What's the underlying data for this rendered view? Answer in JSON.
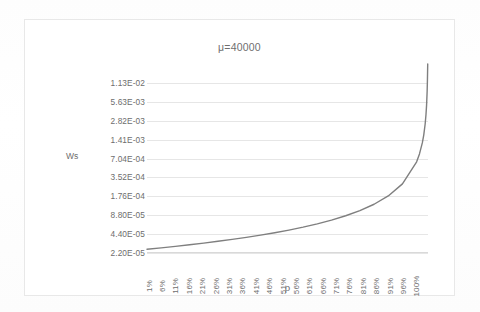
{
  "chart_data": {
    "type": "line",
    "title": "μ=40000",
    "xlabel": "ρ",
    "ylabel": "Ws",
    "yscale": "log",
    "grid": true,
    "legend": "none",
    "series_color": "#7f7f7f",
    "gridline_color": "#e6e6e6",
    "axis_text_color": "#6d6d6d",
    "y_tick_labels": [
      "1.13E-02",
      "5.63E-03",
      "2.82E-03",
      "1.41E-03",
      "7.04E-04",
      "3.52E-04",
      "1.76E-04",
      "8.80E-05",
      "4.40E-05",
      "2.20E-05"
    ],
    "y_tick_values": [
      0.0113,
      0.00563,
      0.00282,
      0.00141,
      0.000704,
      0.000352,
      0.000176,
      8.8e-05,
      4.4e-05,
      2.2e-05
    ],
    "ylim": [
      2.2e-05,
      0.0226
    ],
    "x_tick_labels": [
      "1%",
      "6%",
      "11%",
      "16%",
      "21%",
      "26%",
      "31%",
      "36%",
      "41%",
      "46%",
      "51%",
      "56%",
      "61%",
      "66%",
      "71%",
      "76%",
      "81%",
      "86%",
      "91%",
      "96%",
      "100%"
    ],
    "xlim": [
      0.01,
      1.0
    ],
    "x": [
      0.01,
      0.06,
      0.11,
      0.16,
      0.21,
      0.26,
      0.31,
      0.36,
      0.41,
      0.46,
      0.51,
      0.56,
      0.61,
      0.66,
      0.71,
      0.76,
      0.81,
      0.86,
      0.91,
      0.96,
      0.97,
      0.98,
      0.985,
      0.99,
      0.993,
      0.995,
      0.997,
      0.998,
      0.999
    ],
    "values": [
      2.525e-05,
      2.66e-05,
      2.809e-05,
      2.976e-05,
      3.165e-05,
      3.378e-05,
      3.623e-05,
      3.906e-05,
      4.237e-05,
      4.63e-05,
      5.102e-05,
      5.682e-05,
      6.41e-05,
      7.353e-05,
      8.621e-05,
      0.00010417,
      0.00013158,
      0.00017857,
      0.00027778,
      0.000625,
      0.00083333,
      0.00125,
      0.00166667,
      0.0025,
      0.00357143,
      0.005,
      0.00833333,
      0.0125,
      0.025
    ]
  }
}
